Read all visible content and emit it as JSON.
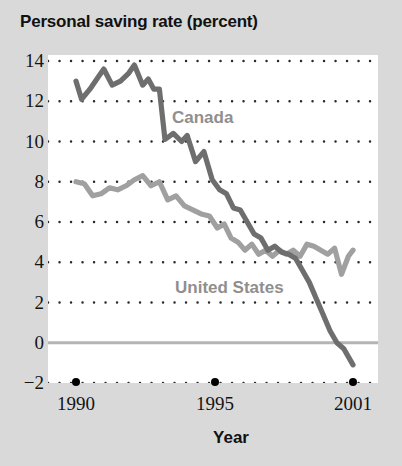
{
  "chart_data": {
    "type": "line",
    "title": "Personal saving rate (percent)",
    "xlabel": "Year",
    "ylabel": "",
    "xlim": [
      1990,
      2001
    ],
    "ylim": [
      -2,
      14
    ],
    "yticks": [
      14,
      12,
      10,
      8,
      6,
      4,
      2,
      0,
      -2
    ],
    "ytick_labels": [
      "14",
      "12",
      "10",
      "8",
      "6",
      "4",
      "2",
      "0",
      "−2"
    ],
    "xticks": [
      1990,
      1995,
      2001
    ],
    "xtick_labels": [
      "1990",
      "1995",
      "2001"
    ],
    "grid": "dotted-horizontal",
    "zero_line": true,
    "legend_position": "inline-annotations",
    "colors": {
      "background": "#d9d9d9",
      "plot_background": "#ffffff",
      "canada_line": "#6e6e6e",
      "united_states_line": "#a0a0a0",
      "zero_line": "#b4b4b4",
      "grid_dot": "#2a2a2a",
      "title_text": "#111111",
      "tick_text": "#141414",
      "series_label": "#8f8f8f"
    },
    "series": [
      {
        "name": "Canada",
        "label": "Canada",
        "color": "#6e6e6e",
        "x": [
          1990.0,
          1990.2,
          1990.5,
          1990.8,
          1991.0,
          1991.3,
          1991.6,
          1991.9,
          1992.1,
          1992.4,
          1992.6,
          1992.8,
          1993.0,
          1993.2,
          1993.5,
          1993.8,
          1994.0,
          1994.3,
          1994.6,
          1994.9,
          1995.2,
          1995.5,
          1995.8,
          1996.1,
          1996.4,
          1996.7,
          1997.0,
          1997.3,
          1997.6,
          1997.9,
          1998.2,
          1998.5,
          1998.8,
          1999.1,
          1999.4,
          1999.7,
          2000.0,
          2000.3,
          2000.6,
          2001.0
        ],
        "values": [
          13.0,
          12.1,
          12.6,
          13.2,
          13.6,
          12.8,
          13.0,
          13.4,
          13.8,
          12.8,
          13.1,
          12.6,
          12.6,
          10.1,
          10.4,
          10.0,
          10.3,
          9.0,
          9.5,
          8.1,
          7.6,
          7.4,
          6.7,
          6.6,
          6.0,
          5.4,
          5.2,
          4.6,
          4.8,
          4.5,
          4.4,
          4.2,
          3.6,
          3.0,
          2.2,
          1.4,
          0.6,
          0.0,
          -0.3,
          -1.1
        ]
      },
      {
        "name": "United States",
        "label": "United States",
        "color": "#a0a0a0",
        "x": [
          1990.0,
          1990.3,
          1990.6,
          1990.9,
          1991.2,
          1991.5,
          1991.8,
          1992.1,
          1992.4,
          1992.7,
          1993.0,
          1993.3,
          1993.6,
          1993.9,
          1994.2,
          1994.5,
          1994.8,
          1995.1,
          1995.4,
          1995.7,
          1996.0,
          1996.3,
          1996.6,
          1996.9,
          1997.2,
          1997.5,
          1997.8,
          1998.1,
          1998.4,
          1998.7,
          1999.0,
          1999.3,
          1999.6,
          1999.9,
          2000.2,
          2000.5,
          2000.8,
          2001.0
        ],
        "values": [
          8.0,
          7.9,
          7.3,
          7.4,
          7.7,
          7.6,
          7.8,
          8.1,
          8.3,
          7.8,
          8.0,
          7.1,
          7.3,
          6.8,
          6.6,
          6.4,
          6.3,
          5.7,
          5.9,
          5.2,
          5.0,
          4.6,
          4.9,
          4.4,
          4.6,
          4.3,
          4.6,
          4.4,
          4.6,
          4.3,
          4.9,
          4.8,
          4.6,
          4.4,
          4.7,
          3.4,
          4.3,
          4.6
        ]
      }
    ]
  }
}
